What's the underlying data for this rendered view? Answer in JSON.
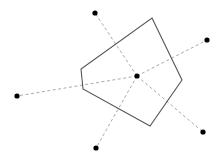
{
  "diagram": {
    "type": "voronoi-cell",
    "width": 221,
    "height": 155,
    "colors": {
      "background": "#ffffff",
      "cell_stroke": "#555555",
      "link_stroke": "#aaaaaa",
      "site_fill": "#000000"
    },
    "center_site": {
      "x": 137,
      "y": 76
    },
    "neighbor_sites": [
      {
        "x": 95,
        "y": 13
      },
      {
        "x": 207,
        "y": 40
      },
      {
        "x": 203,
        "y": 132
      },
      {
        "x": 96,
        "y": 148
      },
      {
        "x": 17,
        "y": 96
      }
    ],
    "cell_vertices": [
      {
        "x": 152,
        "y": 18
      },
      {
        "x": 182,
        "y": 80
      },
      {
        "x": 150,
        "y": 126
      },
      {
        "x": 83,
        "y": 89
      },
      {
        "x": 81,
        "y": 69
      }
    ]
  }
}
